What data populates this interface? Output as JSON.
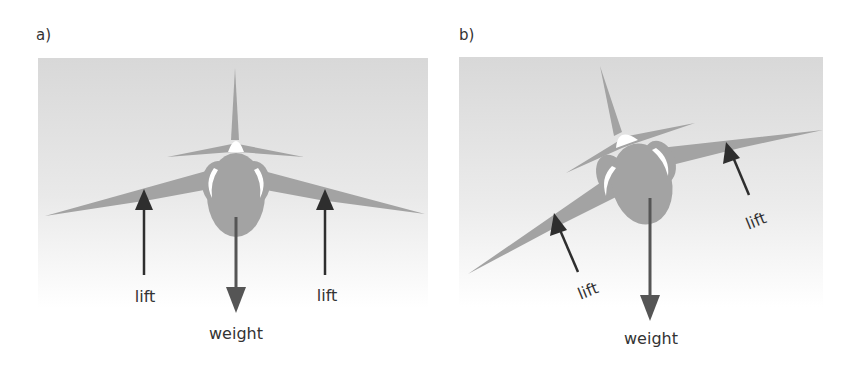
{
  "colors": {
    "aircraft": "#a3a3a3",
    "canopy": "#ffffff",
    "lift_arrow": "#2e2e2e",
    "weight_arrow": "#555555",
    "sky_top": "#d9d9d9",
    "sky_bottom": "#ffffff",
    "text": "#333333"
  },
  "panels": [
    {
      "label": "a)",
      "description": "aircraft in level flight",
      "forces": {
        "lift_left": "lift",
        "lift_right": "lift",
        "weight": "weight"
      }
    },
    {
      "label": "b)",
      "description": "aircraft banking",
      "forces": {
        "lift_left": "lift",
        "lift_right": "lift",
        "weight": "weight"
      }
    }
  ]
}
